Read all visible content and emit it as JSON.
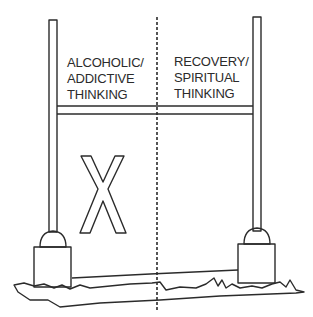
{
  "diagram": {
    "left_side": {
      "lines": [
        "ALCOHOLIC/",
        "ADDICTIVE",
        "THINKING"
      ]
    },
    "right_side": {
      "lines": [
        "RECOVERY/",
        "SPIRITUAL",
        "THINKING"
      ]
    },
    "center_mark": "X",
    "colors": {
      "stroke": "#2b2b2b",
      "background": "#ffffff"
    }
  }
}
